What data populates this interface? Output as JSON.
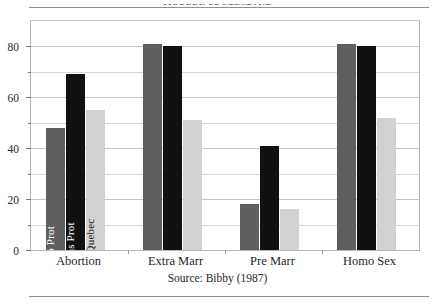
{
  "figure": {
    "top_caption": "MODERN PROTESTANT",
    "source_note": "Source: Bibby (1987)"
  },
  "chart_data": {
    "type": "bar",
    "title": "",
    "subtitle": "",
    "xlabel": "",
    "ylabel": "",
    "ylim": [
      0,
      90
    ],
    "yticks": [
      0,
      20,
      40,
      60,
      80
    ],
    "yticks_minor": [
      10,
      30,
      50,
      70
    ],
    "ytick_labels": [
      "0",
      "20",
      "40",
      "60",
      "80"
    ],
    "grid": true,
    "legend_position": "inside-first-group-rotated",
    "categories": [
      "Abortion",
      "Extra Marr",
      "Pre Marr",
      "Homo Sex"
    ],
    "series": [
      {
        "name": "Lib Prot",
        "color": "#5f5f5f",
        "values": [
          48,
          81,
          18,
          81
        ]
      },
      {
        "name": "Cons Prot",
        "color": "#111111",
        "values": [
          69,
          80,
          41,
          80
        ]
      },
      {
        "name": "RC Quebec",
        "color": "#d2d2d2",
        "values": [
          55,
          51,
          16,
          52
        ]
      }
    ]
  }
}
